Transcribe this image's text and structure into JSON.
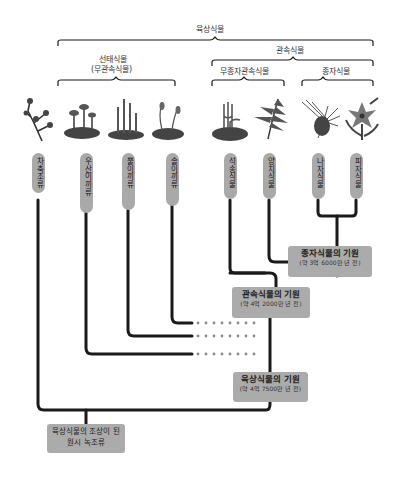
{
  "groups": {
    "land_plants": "육상식물",
    "vascular_plants": "관속식물",
    "bryophytes": "선태식물",
    "bryophytes_alt": "(무관속식물)",
    "seedless_vascular": "무종자관속식물",
    "seed_plants": "종자식물"
  },
  "taxa": [
    {
      "label": "차축조류",
      "icon": "charophyte-icon"
    },
    {
      "label": "우산이끼류",
      "icon": "liverwort-icon"
    },
    {
      "label": "뿔이끼류",
      "icon": "hornwort-icon"
    },
    {
      "label": "솔이끼류",
      "icon": "moss-icon"
    },
    {
      "label": "석송식물",
      "icon": "lycophyte-icon"
    },
    {
      "label": "양치식물",
      "icon": "fern-icon"
    },
    {
      "label": "나자식물",
      "icon": "gymnosperm-icon"
    },
    {
      "label": "피자식물",
      "icon": "angiosperm-icon"
    }
  ],
  "origins": {
    "seed": {
      "title": "종자식물의 기원",
      "time": "(약 3억 6000만 년 전)"
    },
    "vascular": {
      "title": "관속식물의 기원",
      "time": "(약 4억 2000만 년 전)"
    },
    "land": {
      "title": "육상식물의 기원",
      "time": "(약 4억 7500만 년 전)"
    },
    "ancestor": {
      "title": "육상식물의 조상이 된",
      "subtitle": "원시 녹조류"
    }
  },
  "colors": {
    "line": "#1a1a1a",
    "pill": "#a9a9a9",
    "box": "#ababab",
    "dots": "#8a8a8a"
  }
}
